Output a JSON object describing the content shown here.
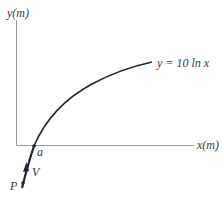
{
  "diagram": {
    "axes": {
      "y_label": "y(m)",
      "x_label": "x(m)"
    },
    "curve": {
      "equation_label": "y = 10 ln x",
      "color": "#1f2430"
    },
    "points": {
      "a_label": "a",
      "p_label": "P"
    },
    "vector": {
      "v_label": "V"
    },
    "colors": {
      "axis": "#9a9a9a",
      "text": "#3a3a3a"
    }
  }
}
